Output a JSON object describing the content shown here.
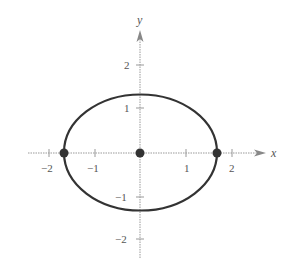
{
  "diagram": {
    "type": "ellipse-plot",
    "axes": {
      "x_label": "x",
      "y_label": "y",
      "x_ticks": [
        {
          "value": -2,
          "label": "−2"
        },
        {
          "value": -1,
          "label": "−1"
        },
        {
          "value": 1,
          "label": "1"
        },
        {
          "value": 2,
          "label": "2"
        }
      ],
      "y_ticks": [
        {
          "value": 2,
          "label": "2"
        },
        {
          "value": 1,
          "label": "1"
        },
        {
          "value": -1,
          "label": "−1"
        },
        {
          "value": -2,
          "label": "−2"
        }
      ]
    },
    "ellipse": {
      "center": [
        0,
        0
      ],
      "rx": 1.68,
      "ry": 1.27,
      "color": "#333333"
    },
    "points": [
      {
        "name": "left-vertex",
        "x": -1.68,
        "y": 0
      },
      {
        "name": "center",
        "x": 0,
        "y": 0
      },
      {
        "name": "right-vertex",
        "x": 1.68,
        "y": 0
      }
    ]
  }
}
